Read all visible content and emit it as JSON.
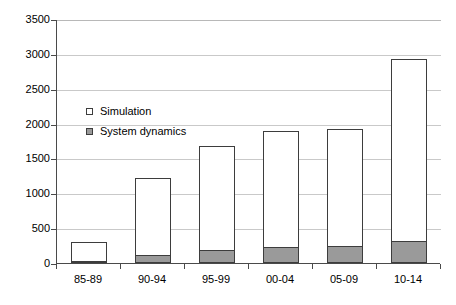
{
  "chart_data": {
    "type": "bar",
    "stacked": true,
    "title": "",
    "xlabel": "",
    "ylabel": "",
    "categories": [
      "85-89",
      "90-94",
      "95-99",
      "00-04",
      "05-09",
      "10-14"
    ],
    "series": [
      {
        "name": "System dynamics",
        "color": "#9a9a9a",
        "values": [
          10,
          100,
          170,
          215,
          235,
          305
        ]
      },
      {
        "name": "Simulation",
        "color": "#ffffff",
        "values": [
          290,
          1120,
          1510,
          1685,
          1685,
          2615
        ]
      }
    ],
    "totals": [
      300,
      1220,
      1680,
      1900,
      1920,
      2920
    ],
    "ylim": [
      0,
      3500
    ],
    "y_ticks": [
      0,
      500,
      1000,
      1500,
      2000,
      2500,
      3000,
      3500
    ],
    "y_tick_labels": [
      "0",
      "500",
      "1000",
      "1500",
      "2000",
      "2500",
      "3000",
      "3500"
    ],
    "grid": true,
    "legend_position": "inside-upper-left",
    "legend_entries": [
      {
        "label": "Simulation",
        "marker": "hollow-square",
        "color": "#ffffff"
      },
      {
        "label": "System dynamics",
        "marker": "filled-square",
        "color": "#9a9a9a"
      }
    ]
  },
  "axis": {
    "line_color": "#4a4a4a",
    "grid_color": "#c9c9c9"
  }
}
